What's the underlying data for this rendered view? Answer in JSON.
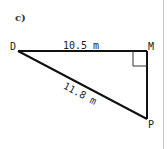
{
  "part_label": "c)",
  "triangle": {
    "vertices": {
      "D": "D",
      "M": "M",
      "P": "P"
    },
    "right_angle_at": "M",
    "sides": {
      "DM": "10.5 m",
      "DP": "11.8 m"
    }
  },
  "colors": {
    "stroke": "#111111",
    "text": "#222222"
  }
}
